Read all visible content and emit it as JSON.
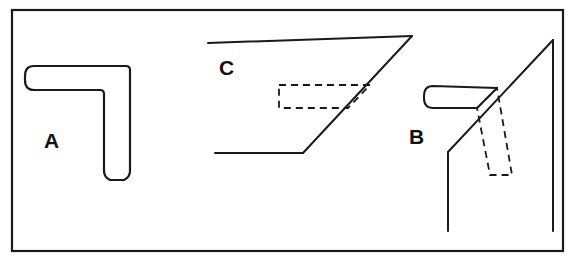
{
  "figure": {
    "background_color": "#ffffff",
    "stroke_color": "#1a1a1a",
    "border": {
      "name": "outer-frame",
      "x": 12,
      "y": 10,
      "width": 551,
      "height": 241,
      "stroke_width": 2.2
    },
    "labels": [
      {
        "id": "A",
        "text": "A",
        "x": 44,
        "y": 130
      },
      {
        "id": "B",
        "text": "B",
        "x": 409,
        "y": 126
      },
      {
        "id": "C",
        "text": "C",
        "x": 219,
        "y": 57
      }
    ],
    "shapes": {
      "a": {
        "name": "L-bracket-solid-outline",
        "label": "A",
        "stroke_width": 2.2,
        "style": "solid",
        "path": "M 34 66 L 126 66 Q 130 66 130 70 L 130 171 Q 130 177 124 180 L 110 180 Q 104 177 104 171 L 104 94 Q 104 90 100 90 L 34 90 Q 25 90 25 80 L 25 76 Q 25 66 34 66 Z"
      },
      "c": {
        "name": "open-trapezoid-outline",
        "label": "C",
        "stroke_width": 2.0,
        "style": "solid",
        "segments": [
          {
            "name": "top-edge",
            "x1": 208,
            "y1": 43,
            "x2": 412,
            "y2": 36
          },
          {
            "name": "diagonal-edge",
            "x1": 412,
            "y1": 36,
            "x2": 303,
            "y2": 153
          },
          {
            "name": "bottom-edge",
            "x1": 303,
            "y1": 153,
            "x2": 215,
            "y2": 153
          }
        ],
        "hidden_rect": {
          "name": "hidden-detail-rectangle",
          "style": "dashed",
          "stroke_width": 1.8,
          "dash": "7 5",
          "points": "279,85 370,85 348,108 279,108"
        }
      },
      "b": {
        "name": "L-bracket-projection",
        "label": "B",
        "stroke_width": 2.0,
        "style": "solid",
        "arm": {
          "name": "rounded-horizontal-arm",
          "path": "M 433 86 L 497 88 L 477 108 L 433 108 Q 424 108 424 98 L 424 96 Q 424 86 433 86 Z"
        },
        "segments": [
          {
            "name": "long-diagonal",
            "x1": 553,
            "y1": 40,
            "x2": 448,
            "y2": 152
          },
          {
            "name": "left-vertical",
            "x1": 448,
            "y1": 152,
            "x2": 448,
            "y2": 231
          },
          {
            "name": "right-vertical",
            "x1": 553,
            "y1": 40,
            "x2": 553,
            "y2": 231
          }
        ],
        "hidden_rect": {
          "name": "hidden-detail-rectangle",
          "style": "dashed",
          "stroke_width": 1.8,
          "dash": "7 5",
          "points": "477,108 497,88 512,175 490,175"
        }
      }
    }
  }
}
